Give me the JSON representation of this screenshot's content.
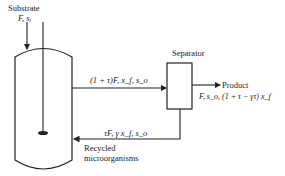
{
  "diagram": {
    "substrate": {
      "title": "Substrate",
      "stream": "F, s_i",
      "stream_display": "F, sᵢ"
    },
    "outlet_stream": "(1 + τ)F, x_f, s_o",
    "outlet_display": "(1 + τ)F, x_f, s_o",
    "separator": {
      "label": "Separator"
    },
    "product": {
      "title": "Product",
      "stream": "F, s_o, (1 + τ − γτ) x_f"
    },
    "recycle": {
      "stream": "τF, γ x_f, s_o",
      "label_line1": "Recycled",
      "label_line2": "microorganisms"
    },
    "colors": {
      "line": "#222222",
      "background": "#ffffff"
    }
  }
}
